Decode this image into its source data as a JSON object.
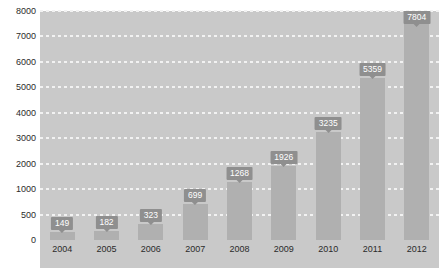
{
  "chart_data": {
    "type": "bar",
    "title": "",
    "subtitle": "",
    "xlabel": "",
    "ylabel": "",
    "categories": [
      "2004",
      "2005",
      "2006",
      "2007",
      "2008",
      "2009",
      "2010",
      "2011",
      "2012"
    ],
    "values": [
      149,
      182,
      323,
      699,
      1268,
      1926,
      3235,
      5359,
      7804
    ],
    "data_labels": [
      "149",
      "182",
      "323",
      "699",
      "1268",
      "1926",
      "3235",
      "5359",
      "7804"
    ],
    "y_ticks": [
      0,
      500,
      1000,
      2000,
      3000,
      4000,
      5000,
      6000,
      7000,
      8000
    ],
    "y_tick_labels": [
      "0",
      "500",
      "1000",
      "2000",
      "3000",
      "4000",
      "5000",
      "6000",
      "7000",
      "8000"
    ],
    "ylim": [
      0,
      8000
    ],
    "axis_note": "non-linear y-axis: gridlines evenly spaced, 0-500 then 1000-8000",
    "grid": true,
    "grid_style": "dotted",
    "legend": false,
    "legend_position": "none",
    "colors": {
      "bar": "#b0b0b0",
      "plot_background": "#c9c9c9",
      "gridline": "#f2f2f2",
      "label_background": "#8f8f8f",
      "label_text": "#ffffff",
      "axis_text": "#2b2b2b"
    }
  }
}
